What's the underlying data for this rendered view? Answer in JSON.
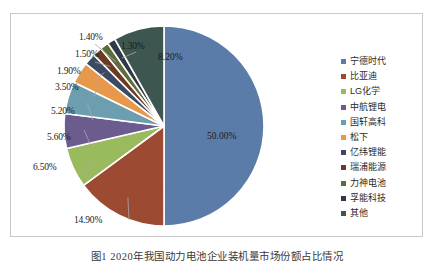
{
  "figure": {
    "caption": "图1  2020年我国动力电池企业装机量市场份额占比情况"
  },
  "legend": {
    "position": "right",
    "items": [
      {
        "label": "宁德时代",
        "color": "#5b7ca8"
      },
      {
        "label": "比亚迪",
        "color": "#9c4a32"
      },
      {
        "label": "LG化学",
        "color": "#9aba5e"
      },
      {
        "label": "中航锂电",
        "color": "#6b5b8e"
      },
      {
        "label": "国轩高科",
        "color": "#6d9eb0"
      },
      {
        "label": "松下",
        "color": "#e8984a"
      },
      {
        "label": "亿纬锂能",
        "color": "#3b4a63"
      },
      {
        "label": "瑞浦能源",
        "color": "#6b3a22"
      },
      {
        "label": "力神电池",
        "color": "#5e6b3a"
      },
      {
        "label": "孚能科技",
        "color": "#2f3a48"
      },
      {
        "label": "其他",
        "color": "#3d5650"
      }
    ]
  },
  "labels": {
    "p1": "50.00%",
    "p2": "14.90%",
    "p3": "6.50%",
    "p4": "5.60%",
    "p5": "5.20%",
    "p6": "3.50%",
    "p7": "1.90%",
    "p8": "1.50%",
    "p9": "1.40%",
    "p10": "1.30%",
    "p11": "8.20%"
  },
  "chart_data": {
    "type": "pie",
    "title": "",
    "categories": [
      "宁德时代",
      "比亚迪",
      "LG化学",
      "中航锂电",
      "国轩高科",
      "松下",
      "亿纬锂能",
      "瑞浦能源",
      "力神电池",
      "孚能科技",
      "其他"
    ],
    "values": [
      50.0,
      14.9,
      6.5,
      5.6,
      5.2,
      3.5,
      1.9,
      1.5,
      1.4,
      1.3,
      8.2
    ],
    "value_labels": [
      "50.00%",
      "14.90%",
      "6.50%",
      "5.60%",
      "5.20%",
      "3.50%",
      "1.90%",
      "1.50%",
      "1.40%",
      "1.30%",
      "8.20%"
    ],
    "colors": [
      "#5b7ca8",
      "#9c4a32",
      "#9aba5e",
      "#6b5b8e",
      "#6d9eb0",
      "#e8984a",
      "#3b4a63",
      "#6b3a22",
      "#5e6b3a",
      "#2f3a48",
      "#3d5650"
    ],
    "unit": "%",
    "legend_position": "right",
    "start_angle": 0,
    "direction": "clockwise",
    "grid": false
  }
}
